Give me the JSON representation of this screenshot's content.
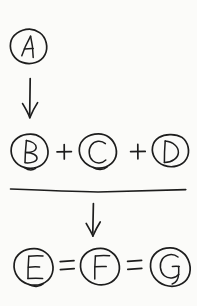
{
  "document": {
    "kind": "handwritten-sketch",
    "title": "Circled letter reaction diagram",
    "background_color": "#fbfbf9",
    "ink_color": "#1d1d1d"
  },
  "rows": [
    {
      "id": "reactant-row",
      "role": "reactant",
      "terms": [
        {
          "id": "term-a",
          "label": "A",
          "circled": true,
          "cx": 28,
          "cy": 46,
          "rx": 18,
          "ry": 17
        }
      ],
      "operators": []
    },
    {
      "id": "products-row",
      "role": "products",
      "terms": [
        {
          "id": "term-b",
          "label": "B",
          "circled": true,
          "cx": 30,
          "cy": 152,
          "rx": 19,
          "ry": 18
        },
        {
          "id": "term-c",
          "label": "C",
          "circled": true,
          "cx": 98,
          "cy": 152,
          "rx": 19,
          "ry": 18
        },
        {
          "id": "term-d",
          "label": "D",
          "circled": true,
          "cx": 170,
          "cy": 152,
          "rx": 19,
          "ry": 17
        }
      ],
      "operators": [
        {
          "id": "plus-1",
          "symbol": "+",
          "x": 64,
          "y": 152
        },
        {
          "id": "plus-2",
          "symbol": "+",
          "x": 138,
          "y": 152
        }
      ]
    },
    {
      "id": "result-row",
      "role": "result",
      "terms": [
        {
          "id": "term-e",
          "label": "E",
          "circled": true,
          "cx": 34,
          "cy": 268,
          "rx": 20,
          "ry": 19
        },
        {
          "id": "term-f",
          "label": "F",
          "circled": true,
          "cx": 100,
          "cy": 268,
          "rx": 20,
          "ry": 19
        },
        {
          "id": "term-g",
          "label": "G",
          "circled": true,
          "cx": 170,
          "cy": 268,
          "rx": 20,
          "ry": 20
        }
      ],
      "operators": [
        {
          "id": "equals-1",
          "symbol": "=",
          "x": 67,
          "y": 266
        },
        {
          "id": "equals-2",
          "symbol": "=",
          "x": 135,
          "y": 266
        }
      ]
    }
  ],
  "arrows": [
    {
      "id": "arrow-1",
      "direction": "down",
      "x": 30,
      "y_start": 78,
      "y_end": 118
    },
    {
      "id": "arrow-2",
      "direction": "down",
      "x": 93,
      "y_start": 203,
      "y_end": 236
    }
  ],
  "divider": {
    "id": "horizontal-rule",
    "x_start": 10,
    "x_end": 186,
    "y": 190
  }
}
